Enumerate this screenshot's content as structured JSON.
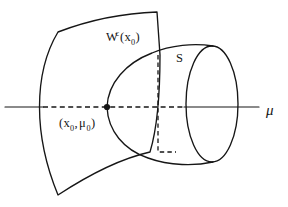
{
  "figure": {
    "kind": "center-manifold-diagram",
    "background_color": "#ffffff",
    "ink_color": "#161616",
    "width": 288,
    "height": 207
  },
  "labels": {
    "center_manifold": {
      "base": "W",
      "superscript": "c",
      "open_paren": "(",
      "arg_base": "x",
      "arg_sub": "0",
      "close_paren": ")",
      "full_text": "W^c(x_0)",
      "x": 106,
      "y": 41
    },
    "surface_s": {
      "text": "S",
      "x": 176,
      "y": 62
    },
    "point": {
      "open_paren": "(",
      "x_base": "x",
      "x_sub": "0",
      "comma": ",",
      "mu_base": "μ",
      "mu_sub": "0",
      "close_paren": ")",
      "full_text": "(x_0, μ_0)",
      "x": 59,
      "y": 127
    },
    "axis": {
      "text": "μ",
      "name": "mu-axis-label",
      "x": 268,
      "y": 115
    }
  },
  "axis": {
    "name": "mu-axis",
    "y": 107,
    "solid_left": {
      "x1": 5,
      "x2": 42
    },
    "dashed_middle": {
      "x1": 42,
      "x2": 183
    },
    "solid_right": {
      "x1": 183,
      "x2": 259
    }
  },
  "marked_point": {
    "name": "point-x0-mu0",
    "cx": 107,
    "cy": 107,
    "r": 3.1
  },
  "geometry": {
    "center_manifold_sheet": {
      "name": "center-manifold-surface",
      "path": "M 58 32 C 92 19 128 13 157 12 L 160 55 C 160 90 158 128 150 152 C 120 158 88 175 58 195 C 44 160 40 132 40 107 C 40 78 46 52 58 32 Z"
    },
    "paraboloid_s": {
      "name": "surface-s-outline",
      "upper": "M 107 107 C 109 82 126 62 152 52 C 172 44 194 43 212 46",
      "lower": "M 107 107 C 109 130 124 149 148 158 C 170 166 194 166 212 162"
    },
    "rim_ellipse": {
      "name": "surface-s-rim",
      "cx": 212,
      "cy": 104,
      "rx": 26,
      "ry": 58
    },
    "dashed_generator": {
      "name": "generator-dashed-line",
      "path": "M 158 55 L 158 152 L 175 152"
    }
  }
}
